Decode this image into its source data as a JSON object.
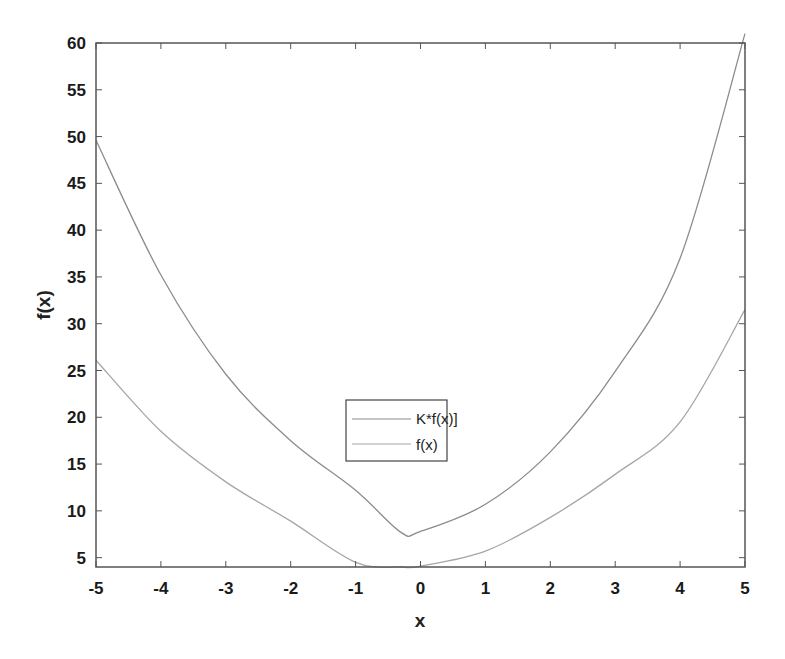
{
  "chart_data": {
    "type": "line",
    "title": "",
    "xlabel": "x",
    "ylabel": "f(x)",
    "xlim": [
      -5,
      5
    ],
    "ylim": [
      4,
      60
    ],
    "grid": false,
    "legend_position": "center-lower",
    "xticks": [
      -5,
      -4,
      -3,
      -2,
      -1,
      0,
      1,
      2,
      3,
      4,
      5
    ],
    "yticks": [
      5,
      10,
      15,
      20,
      25,
      30,
      35,
      40,
      45,
      50,
      55,
      60
    ],
    "x": [
      -5,
      -4,
      -3,
      -2,
      -1,
      -0.3,
      0,
      1,
      2,
      3,
      4,
      5
    ],
    "series": [
      {
        "name": "K*f(x)]",
        "color": "#8c8c8c",
        "values": [
          49.6,
          35.2,
          24.6,
          17.5,
          12.2,
          7.7,
          7.8,
          10.7,
          16.3,
          24.9,
          37.0,
          61.0
        ]
      },
      {
        "name": "f(x)",
        "color": "#a6a6a6",
        "values": [
          26.1,
          18.5,
          13.1,
          8.9,
          4.5,
          4.0,
          4.1,
          5.7,
          9.3,
          13.9,
          19.5,
          31.5
        ]
      }
    ]
  },
  "legend": {
    "items": [
      "K*f(x)]",
      "f(x)"
    ]
  },
  "axes": {
    "xlabel": "x",
    "ylabel": "f(x)",
    "xtick_labels": [
      "-5",
      "-4",
      "-3",
      "-2",
      "-1",
      "0",
      "1",
      "2",
      "3",
      "4",
      "5"
    ],
    "ytick_labels": [
      "5",
      "10",
      "15",
      "20",
      "25",
      "30",
      "35",
      "40",
      "45",
      "50",
      "55",
      "60"
    ]
  },
  "colors": {
    "axis": "#555555",
    "series1": "#8c8c8c",
    "series2": "#a6a6a6"
  }
}
